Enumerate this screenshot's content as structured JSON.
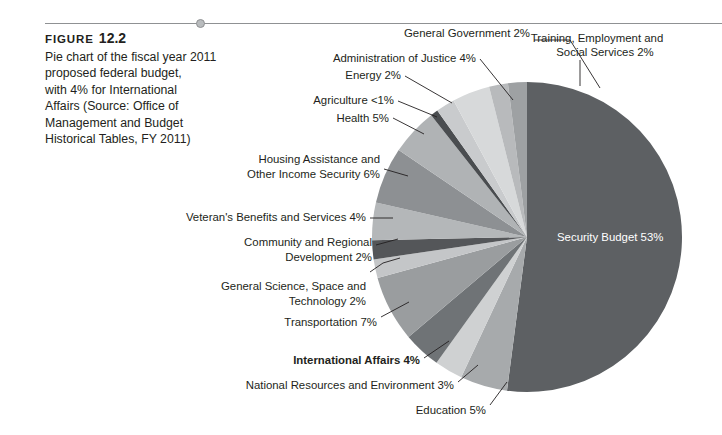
{
  "figure": {
    "label": "FIGURE",
    "number": "12.2",
    "caption_lines": [
      "Pie chart of the fiscal year 2011",
      "proposed federal budget,",
      "with 4% for International",
      "Affairs (Source: Office of",
      "Management and Budget",
      "Historical Tables, FY 2011)"
    ],
    "caption_full": "Pie chart of the fiscal year 2011 proposed federal budget, with 4% for International Affairs (Source: Office of Management and Budget Historical Tables, FY 2011)"
  },
  "rule": {
    "dot_name": "rule-dot"
  },
  "chart_data": {
    "type": "pie",
    "title": "Fiscal Year 2011 Proposed Federal Budget",
    "unit": "percent",
    "total": 100,
    "start_angle_deg": -90,
    "direction": "clockwise",
    "center": {
      "x": 527,
      "y": 237
    },
    "radius": 155,
    "categories": [
      "Security Budget",
      "Education",
      "National Resources and Environment",
      "International Affairs",
      "Transportation",
      "General Science, Space and Technology",
      "Community and Regional Development",
      "Veteran's Benefits and Services",
      "Housing Assistance and Other Income Security",
      "Health",
      "Agriculture",
      "Energy",
      "Administration of Justice",
      "General Government",
      "Training, Employment and Social Services"
    ],
    "values": [
      53,
      5,
      3,
      4,
      7,
      2,
      2,
      4,
      6,
      5,
      0.8,
      2,
      4,
      2,
      2
    ],
    "value_labels": [
      "53%",
      "5%",
      "3%",
      "4%",
      "7%",
      "2%",
      "2%",
      "4%",
      "6%",
      "5%",
      "<1%",
      "2%",
      "4%",
      "2%",
      "2%"
    ],
    "colors": [
      "#5d6063",
      "#a7aaac",
      "#cfd1d2",
      "#6f7376",
      "#9a9d9f",
      "#c4c6c8",
      "#545659",
      "#b4b7b9",
      "#8d9093",
      "#b0b3b5",
      "#4a4d50",
      "#c9cbcd",
      "#d7d9da",
      "#b8babc",
      "#9ea1a3"
    ],
    "slice_labels": [
      {
        "text": "Security Budget 53%",
        "placement": "inside",
        "bold": false
      },
      {
        "text": "Education 5%",
        "placement": "outside",
        "bold": false
      },
      {
        "text": "National Resources and Environment 3%",
        "placement": "outside",
        "bold": false
      },
      {
        "text": "International Affairs 4%",
        "placement": "outside",
        "bold": true
      },
      {
        "text": "Transportation 7%",
        "placement": "outside",
        "bold": false
      },
      {
        "text": "General Science, Space and",
        "text2": "Technology 2%",
        "placement": "outside",
        "bold": false
      },
      {
        "text": "Community and Regional",
        "text2": "Development 2%",
        "placement": "outside",
        "bold": false
      },
      {
        "text": "Veteran's Benefits and Services 4%",
        "placement": "outside",
        "bold": false
      },
      {
        "text": "Housing Assistance and",
        "text2": "Other Income Security 6%",
        "placement": "outside",
        "bold": false
      },
      {
        "text": "Health 5%",
        "placement": "outside",
        "bold": false
      },
      {
        "text": "Agriculture <1%",
        "placement": "outside",
        "bold": false
      },
      {
        "text": "Energy 2%",
        "placement": "outside",
        "bold": false
      },
      {
        "text": "Administration of Justice 4%",
        "placement": "outside",
        "bold": false
      },
      {
        "text": "General Government 2%",
        "placement": "outside",
        "bold": false
      },
      {
        "text": "Training, Employment and",
        "text2": "Social Services 2%",
        "placement": "outside",
        "bold": false
      }
    ],
    "legend": "none",
    "grid": false
  },
  "labels": {
    "general_government": "General Government 2%",
    "training_employment_1": "Training, Employment and",
    "training_employment_2": "Social Services 2%",
    "administration_justice": "Administration of Justice 4%",
    "energy": "Energy 2%",
    "agriculture": "Agriculture <1%",
    "health": "Health 5%",
    "housing_1": "Housing Assistance and",
    "housing_2": "Other Income Security 6%",
    "veterans": "Veteran's Benefits and Services 4%",
    "community_1": "Community and Regional",
    "community_2": "Development 2%",
    "science_1": "General Science, Space and",
    "science_2": "Technology 2%",
    "transportation": "Transportation 7%",
    "international": "International Affairs 4%",
    "natural_resources": "National Resources and Environment 3%",
    "education": "Education 5%",
    "security": "Security Budget 53%"
  }
}
